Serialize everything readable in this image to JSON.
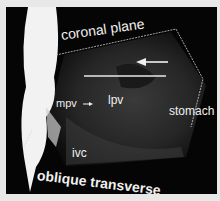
{
  "figure": {
    "type": "medical 3D ultrasound rendering",
    "labels": {
      "coronal": "coronal plane",
      "oblique": "oblique transverse",
      "mpv": "mpv",
      "lpv": "lpv",
      "stomach": "stomach",
      "ivc": "ivc"
    },
    "colors": {
      "background": "#050505",
      "frame": "#e8e8e8",
      "text": "#f0f0f0"
    }
  }
}
